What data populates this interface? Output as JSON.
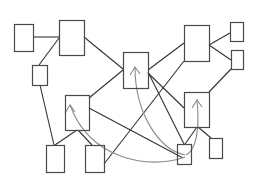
{
  "diagram": {
    "width": 264,
    "height": 182,
    "colors": {
      "background": "#ffffff",
      "node_stroke": "#4a4a4a",
      "edge_stroke": "#333333",
      "curve_stroke": "#8a8a8a"
    },
    "nodes": [
      {
        "id": "A",
        "x": 14,
        "y": 24,
        "w": 19,
        "h": 27
      },
      {
        "id": "B",
        "x": 59,
        "y": 20,
        "w": 25,
        "h": 35
      },
      {
        "id": "C",
        "x": 32,
        "y": 65,
        "w": 15,
        "h": 20
      },
      {
        "id": "D",
        "x": 123,
        "y": 52,
        "w": 25,
        "h": 36
      },
      {
        "id": "E",
        "x": 184,
        "y": 25,
        "w": 25,
        "h": 36
      },
      {
        "id": "F",
        "x": 230,
        "y": 22,
        "w": 13,
        "h": 19
      },
      {
        "id": "G",
        "x": 231,
        "y": 50,
        "w": 12,
        "h": 19
      },
      {
        "id": "H",
        "x": 65,
        "y": 95,
        "w": 24,
        "h": 35
      },
      {
        "id": "I",
        "x": 46,
        "y": 145,
        "w": 18,
        "h": 27
      },
      {
        "id": "J",
        "x": 85,
        "y": 145,
        "w": 19,
        "h": 27
      },
      {
        "id": "K",
        "x": 184,
        "y": 92,
        "w": 25,
        "h": 35
      },
      {
        "id": "L",
        "x": 209,
        "y": 138,
        "w": 13,
        "h": 20
      },
      {
        "id": "M",
        "x": 177,
        "y": 144,
        "w": 14,
        "h": 20
      }
    ],
    "edges": [
      {
        "from": "A",
        "to": "B",
        "x1": 33,
        "y1": 37,
        "x2": 59,
        "y2": 37
      },
      {
        "from": "B",
        "to": "C",
        "x1": 59,
        "y1": 38,
        "x2": 39,
        "y2": 65
      },
      {
        "from": "B",
        "to": "D",
        "x1": 84,
        "y1": 37,
        "x2": 123,
        "y2": 69
      },
      {
        "from": "C",
        "to": "I",
        "x1": 40,
        "y1": 85,
        "x2": 54,
        "y2": 145
      },
      {
        "from": "H",
        "to": "I",
        "x1": 77,
        "y1": 130,
        "x2": 55,
        "y2": 145
      },
      {
        "from": "H",
        "to": "J",
        "x1": 78,
        "y1": 130,
        "x2": 92,
        "y2": 145
      },
      {
        "from": "H",
        "to": "D",
        "x1": 89,
        "y1": 98,
        "x2": 123,
        "y2": 70
      },
      {
        "from": "H",
        "to": "M",
        "x1": 89,
        "y1": 108,
        "x2": 183,
        "y2": 158
      },
      {
        "from": "J",
        "to": "E",
        "x1": 104,
        "y1": 164,
        "x2": 184,
        "y2": 61
      },
      {
        "from": "D",
        "to": "E",
        "x1": 148,
        "y1": 70,
        "x2": 184,
        "y2": 43
      },
      {
        "from": "D",
        "to": "M",
        "x1": 148,
        "y1": 72,
        "x2": 184,
        "y2": 144
      },
      {
        "from": "D",
        "to": "K",
        "x1": 148,
        "y1": 73,
        "x2": 184,
        "y2": 108
      },
      {
        "from": "E",
        "to": "F",
        "x1": 209,
        "y1": 45,
        "x2": 230,
        "y2": 33
      },
      {
        "from": "E",
        "to": "G",
        "x1": 209,
        "y1": 45,
        "x2": 231,
        "y2": 60
      },
      {
        "from": "G",
        "to": "K",
        "x1": 231,
        "y1": 69,
        "x2": 209,
        "y2": 92
      },
      {
        "from": "K",
        "to": "L",
        "x1": 198,
        "y1": 127,
        "x2": 211,
        "y2": 138
      },
      {
        "from": "K",
        "to": "M",
        "x1": 197,
        "y1": 127,
        "x2": 185,
        "y2": 144
      }
    ],
    "curves": [
      {
        "from": "M",
        "to": "H",
        "d": "M 185 157 C 150 170, 90 160, 70 105",
        "arrow_tip": [
          70,
          105
        ]
      },
      {
        "from": "M",
        "to": "D",
        "d": "M 185 155 C 160 150, 135 115, 135 67",
        "arrow_tip": [
          135,
          67
        ]
      },
      {
        "from": "M",
        "to": "K",
        "d": "M 186 155 C 196 150, 200 130, 197 100",
        "arrow_tip": [
          197,
          100
        ]
      }
    ]
  }
}
